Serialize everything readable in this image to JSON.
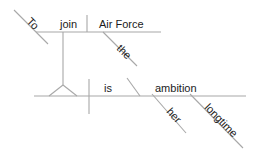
{
  "diagram": {
    "type": "reed-kellogg-sentence-diagram",
    "sentence": "To join the Air Force is her longtime ambition.",
    "line_color": "#a8a8a8",
    "text_color": "#1b1b1b",
    "words": {
      "to": "To",
      "join": "join",
      "air_force": "Air Force",
      "the": "the",
      "is": "is",
      "ambition": "ambition",
      "her": "her",
      "longtime": "longtime"
    },
    "upper_clause": {
      "label": "infinitive-phrase-pedestal",
      "baseline_start_x": 36,
      "baseline_end_x": 161,
      "baseline_y": 32
    },
    "lower_clause": {
      "label": "main-clause-baseline",
      "baseline_start_x": 34,
      "baseline_end_x": 246,
      "baseline_y": 96
    }
  }
}
